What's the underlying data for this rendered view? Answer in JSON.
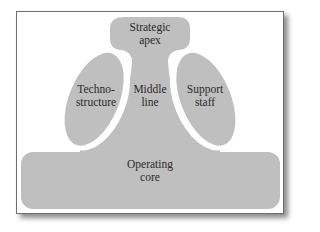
{
  "diagram": {
    "colors": {
      "fill": "#bfbfbf",
      "frame_border": "#6e6e6e",
      "background": "#ffffff",
      "text": "#2a2a2a",
      "gap": "#ffffff"
    },
    "parts": {
      "strategic_apex": {
        "line1": "Strategic",
        "line2": "apex"
      },
      "technostructure": {
        "line1": "Techno-",
        "line2": "structure"
      },
      "middle_line": {
        "line1": "Middle",
        "line2": "line"
      },
      "support_staff": {
        "line1": "Support",
        "line2": "staff"
      },
      "operating_core": {
        "line1": "Operating",
        "line2": "core"
      }
    }
  }
}
